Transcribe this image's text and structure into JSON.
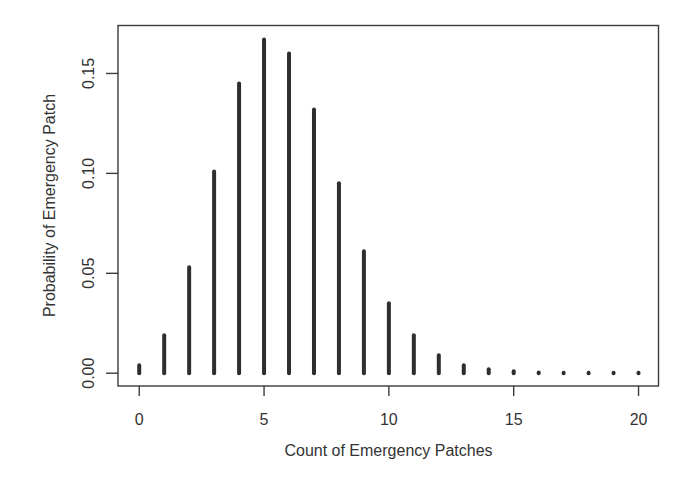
{
  "chart_data": {
    "type": "bar",
    "subtype": "probability-mass-function (vertical lines)",
    "title": "",
    "xlabel": "Count of Emergency Patches",
    "ylabel": "Probability of Emergency Patch",
    "x": [
      0,
      1,
      2,
      3,
      4,
      5,
      6,
      7,
      8,
      9,
      10,
      11,
      12,
      13,
      14,
      15,
      16,
      17,
      18,
      19,
      20
    ],
    "values": [
      0.004,
      0.019,
      0.053,
      0.101,
      0.145,
      0.167,
      0.16,
      0.132,
      0.095,
      0.061,
      0.035,
      0.019,
      0.009,
      0.004,
      0.002,
      0.001,
      0.0003,
      0.0001,
      0.0,
      0.0,
      0.0
    ],
    "xlim": [
      -0.85,
      20.8
    ],
    "ylim": [
      -0.0064,
      0.174
    ],
    "xticks": [
      0,
      5,
      10,
      15,
      20
    ],
    "xtick_labels": [
      "0",
      "5",
      "10",
      "15",
      "20"
    ],
    "yticks": [
      0.0,
      0.05,
      0.1,
      0.15
    ],
    "ytick_labels": [
      "0.00",
      "0.05",
      "0.10",
      "0.15"
    ],
    "grid": false,
    "legend": "none",
    "bar_color": "#2e2e2e",
    "frame_color": "#3a3a3a"
  }
}
